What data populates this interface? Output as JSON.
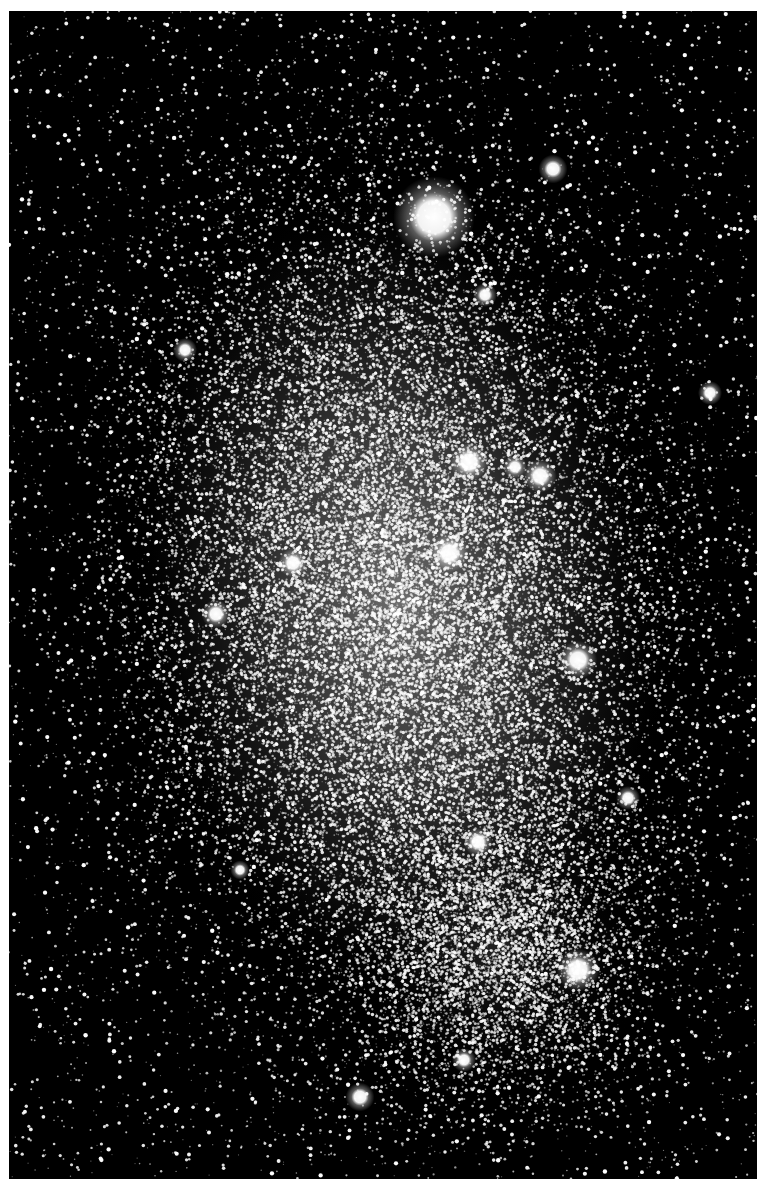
{
  "image": {
    "subject": "irregular galaxy starfield (black and white astronomical photograph)",
    "frame": {
      "x": 9,
      "y": 11,
      "width": 748,
      "height": 1168
    },
    "colors": {
      "background_page": "#ffffff",
      "sky": "#000000",
      "stars": "#ffffff",
      "glow": "#d8d8d8"
    },
    "galaxy": {
      "center": [
        400,
        600
      ],
      "radius_x": 230,
      "radius_y": 360,
      "rotation_deg": -8,
      "tail_center": [
        500,
        950
      ],
      "tail_radius": [
        150,
        150
      ]
    },
    "bright_stars": [
      {
        "x": 434,
        "y": 217,
        "r": 17
      },
      {
        "x": 553,
        "y": 169,
        "r": 6
      },
      {
        "x": 469,
        "y": 462,
        "r": 8
      },
      {
        "x": 540,
        "y": 476,
        "r": 7
      },
      {
        "x": 515,
        "y": 467,
        "r": 5
      },
      {
        "x": 449,
        "y": 553,
        "r": 8
      },
      {
        "x": 293,
        "y": 563,
        "r": 6
      },
      {
        "x": 216,
        "y": 614,
        "r": 6
      },
      {
        "x": 578,
        "y": 660,
        "r": 8
      },
      {
        "x": 628,
        "y": 798,
        "r": 5
      },
      {
        "x": 478,
        "y": 842,
        "r": 6
      },
      {
        "x": 578,
        "y": 970,
        "r": 9
      },
      {
        "x": 710,
        "y": 393,
        "r": 5
      },
      {
        "x": 485,
        "y": 295,
        "r": 5
      },
      {
        "x": 360,
        "y": 1097,
        "r": 6
      },
      {
        "x": 464,
        "y": 1060,
        "r": 5
      },
      {
        "x": 185,
        "y": 350,
        "r": 5
      },
      {
        "x": 240,
        "y": 870,
        "r": 4
      }
    ],
    "star_counts": {
      "field": 5200,
      "galaxy": 26000,
      "tail": 5000
    },
    "seed": 6822
  }
}
